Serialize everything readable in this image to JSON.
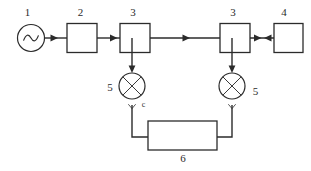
{
  "diagram": {
    "background_color": "#ffffff",
    "line_color": "#2b2b2b",
    "labels": {
      "source": "1",
      "block2": "2",
      "block3_left": "3",
      "block3_right": "3",
      "block4": "4",
      "mixer_left": "5",
      "mixer_right": "5",
      "block6": "6",
      "signal_c": "c"
    },
    "nodes": [
      {
        "id": "source",
        "kind": "ac-source-circle",
        "label": "1"
      },
      {
        "id": "block2",
        "kind": "rectangle",
        "label": "2"
      },
      {
        "id": "block3-left",
        "kind": "rectangle",
        "label": "3"
      },
      {
        "id": "block3-right",
        "kind": "rectangle",
        "label": "3"
      },
      {
        "id": "block4",
        "kind": "rectangle",
        "label": "4"
      },
      {
        "id": "mixer-left",
        "kind": "mixer-circle-x",
        "label": "5"
      },
      {
        "id": "mixer-right",
        "kind": "mixer-circle-x",
        "label": "5"
      },
      {
        "id": "block6",
        "kind": "rectangle-wide",
        "label": "6"
      }
    ]
  }
}
